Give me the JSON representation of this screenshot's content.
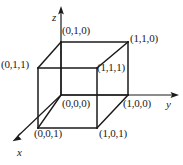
{
  "figure": {
    "type": "unit-cube-3d-diagram",
    "background_color": "#ffffff",
    "line_color": "#1a1a1a",
    "text_color": "#1a1a1a"
  },
  "axes": [
    {
      "name": "z",
      "label": "z",
      "direction": "up",
      "tip": [
        61,
        8
      ],
      "origin": [
        61,
        95
      ]
    },
    {
      "name": "y",
      "label": "y",
      "direction": "right",
      "tip": [
        178,
        95
      ],
      "origin": [
        61,
        95
      ]
    },
    {
      "name": "x",
      "label": "x",
      "direction": "down-left",
      "tip": [
        13,
        140
      ],
      "origin": [
        61,
        95
      ]
    }
  ],
  "axis_labels": {
    "z": "z",
    "y": "y",
    "x": "x"
  },
  "vertices": [
    {
      "id": "v010",
      "label": "(0,1,0)",
      "point": [
        61,
        42
      ],
      "label_pos": [
        62,
        25
      ]
    },
    {
      "id": "v110",
      "label": "(1,1,0)",
      "point": [
        128,
        42
      ],
      "label_pos": [
        130,
        33
      ]
    },
    {
      "id": "v011",
      "label": "(0,1,1)",
      "point": [
        38,
        68
      ],
      "label_pos": [
        2,
        59
      ]
    },
    {
      "id": "v111",
      "label": "(1,1,1)",
      "point": [
        97,
        68
      ],
      "label_pos": [
        97,
        62
      ]
    },
    {
      "id": "v000",
      "label": "(0,0,0)",
      "point": [
        61,
        95
      ],
      "label_pos": [
        62,
        98
      ]
    },
    {
      "id": "v100",
      "label": "(1,0,0)",
      "point": [
        128,
        95
      ],
      "label_pos": [
        123,
        98
      ]
    },
    {
      "id": "v001",
      "label": "(0,0,1)",
      "point": [
        38,
        128
      ],
      "label_pos": [
        34,
        128
      ]
    },
    {
      "id": "v101",
      "label": "(1,0,1)",
      "point": [
        97,
        128
      ],
      "label_pos": [
        99,
        128
      ]
    }
  ],
  "edges": [
    {
      "name": "edge-top-back",
      "from": "v010",
      "to": "v110"
    },
    {
      "name": "edge-top-left",
      "from": "v010",
      "to": "v011"
    },
    {
      "name": "edge-top-right",
      "from": "v110",
      "to": "v111"
    },
    {
      "name": "edge-top-front",
      "from": "v011",
      "to": "v111"
    },
    {
      "name": "edge-left-vertical",
      "from": "v011",
      "to": "v001"
    },
    {
      "name": "edge-back-vertical",
      "from": "v010",
      "to": "v000"
    },
    {
      "name": "edge-right-vertical",
      "from": "v110",
      "to": "v100"
    },
    {
      "name": "edge-mid-vertical",
      "from": "v111",
      "to": "v101"
    },
    {
      "name": "edge-bottom-back",
      "from": "v000",
      "to": "v100"
    },
    {
      "name": "edge-bottom-left",
      "from": "v000",
      "to": "v001"
    },
    {
      "name": "edge-bottom-front",
      "from": "v001",
      "to": "v101"
    },
    {
      "name": "edge-bottom-right",
      "from": "v101",
      "to": "v100"
    }
  ]
}
